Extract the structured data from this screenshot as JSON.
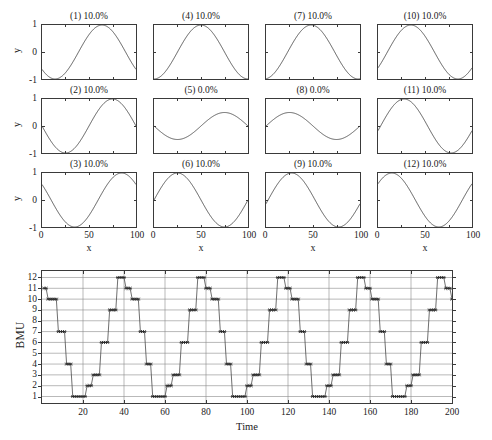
{
  "figure": {
    "background": "#ffffff",
    "line_color": "#4a4a4a",
    "axis_color": "#3a3a3a",
    "grid_color": "#8a8a8a",
    "marker_color": "#2b2b2b"
  },
  "small_multiples": {
    "rows": 3,
    "cols": 4,
    "y_axis_label": "y",
    "x_axis_label": "x",
    "y_ticks": [
      "1",
      "0",
      "-1"
    ],
    "y_tick_values": [
      1,
      0,
      -1
    ],
    "x_ticks": [
      "0",
      "50",
      "100"
    ],
    "x_tick_values": [
      0,
      50,
      100
    ],
    "xlim": [
      0,
      100
    ],
    "ylim": [
      -1,
      1
    ],
    "panels": [
      {
        "index": "1",
        "label": "(1) 10.0%",
        "percent": "10.0%",
        "amplitude": 1.0,
        "period": 100,
        "phase_deg": -140,
        "col": 0,
        "row": 0
      },
      {
        "index": "2",
        "label": "(2) 10.0%",
        "percent": "10.0%",
        "amplitude": 1.0,
        "period": 100,
        "phase_deg": 180,
        "col": 0,
        "row": 1
      },
      {
        "index": "3",
        "label": "(3) 10.0%",
        "percent": "10.0%",
        "amplitude": 1.0,
        "period": 100,
        "phase_deg": 145,
        "col": 0,
        "row": 2
      },
      {
        "index": "4",
        "label": "(4) 10.0%",
        "percent": "10.0%",
        "amplitude": 1.0,
        "period": 100,
        "phase_deg": -90,
        "col": 1,
        "row": 0
      },
      {
        "index": "5",
        "label": "(5) 0.0%",
        "percent": "0.0%",
        "amplitude": 0.5,
        "period": 100,
        "phase_deg": 180,
        "col": 1,
        "row": 1
      },
      {
        "index": "6",
        "label": "(6) 10.0%",
        "percent": "10.0%",
        "amplitude": 1.0,
        "period": 100,
        "phase_deg": 0,
        "col": 1,
        "row": 2
      },
      {
        "index": "7",
        "label": "(7) 10.0%",
        "percent": "10.0%",
        "amplitude": 1.0,
        "period": 100,
        "phase_deg": -83,
        "col": 2,
        "row": 0
      },
      {
        "index": "8",
        "label": "(8) 0.0%",
        "percent": "0.0%",
        "amplitude": 0.5,
        "period": 100,
        "phase_deg": 0,
        "col": 2,
        "row": 1
      },
      {
        "index": "9",
        "label": "(9) 10.0%",
        "percent": "10.0%",
        "amplitude": 1.0,
        "period": 100,
        "phase_deg": -8,
        "col": 2,
        "row": 2
      },
      {
        "index": "10",
        "label": "(10) 10.0%",
        "percent": "10.0%",
        "amplitude": 1.0,
        "period": 100,
        "phase_deg": -36,
        "col": 3,
        "row": 0
      },
      {
        "index": "11",
        "label": "(11) 10.0%",
        "percent": "10.0%",
        "amplitude": 1.0,
        "period": 100,
        "phase_deg": -10,
        "col": 3,
        "row": 1
      },
      {
        "index": "12",
        "label": "(12) 10.0%",
        "percent": "10.0%",
        "amplitude": 1.0,
        "period": 100,
        "phase_deg": 37,
        "col": 3,
        "row": 2
      }
    ]
  },
  "chart_data": {
    "type": "line",
    "title": "",
    "xlabel": "Time",
    "ylabel": "BMU",
    "xlim": [
      0,
      200
    ],
    "ylim": [
      0.4,
      12.6
    ],
    "grid": true,
    "legend": "none",
    "marker": "asterisk",
    "x_ticks": [
      "20",
      "40",
      "60",
      "80",
      "100",
      "120",
      "140",
      "160",
      "180",
      "200"
    ],
    "x_tick_values": [
      20,
      40,
      60,
      80,
      100,
      120,
      140,
      160,
      180,
      200
    ],
    "y_ticks": [
      "1",
      "2",
      "3",
      "4",
      "5",
      "6",
      "7",
      "8",
      "9",
      "10",
      "11",
      "12"
    ],
    "y_tick_values": [
      1,
      2,
      3,
      4,
      5,
      6,
      7,
      8,
      9,
      10,
      11,
      12
    ],
    "x": [
      1,
      2,
      3,
      4,
      5,
      6,
      7,
      8,
      9,
      10,
      11,
      12,
      13,
      14,
      15,
      16,
      17,
      18,
      19,
      20,
      21,
      22,
      23,
      24,
      25,
      26,
      27,
      28,
      29,
      30,
      31,
      32,
      33,
      34,
      35,
      36,
      37,
      38,
      39,
      40,
      41,
      42,
      43,
      44,
      45,
      46,
      47,
      48,
      49,
      50,
      51,
      52,
      53,
      54,
      55,
      56,
      57,
      58,
      59,
      60,
      61,
      62,
      63,
      64,
      65,
      66,
      67,
      68,
      69,
      70,
      71,
      72,
      73,
      74,
      75,
      76,
      77,
      78,
      79,
      80,
      81,
      82,
      83,
      84,
      85,
      86,
      87,
      88,
      89,
      90,
      91,
      92,
      93,
      94,
      95,
      96,
      97,
      98,
      99,
      100,
      101,
      102,
      103,
      104,
      105,
      106,
      107,
      108,
      109,
      110,
      111,
      112,
      113,
      114,
      115,
      116,
      117,
      118,
      119,
      120,
      121,
      122,
      123,
      124,
      125,
      126,
      127,
      128,
      129,
      130,
      131,
      132,
      133,
      134,
      135,
      136,
      137,
      138,
      139,
      140,
      141,
      142,
      143,
      144,
      145,
      146,
      147,
      148,
      149,
      150,
      151,
      152,
      153,
      154,
      155,
      156,
      157,
      158,
      159,
      160,
      161,
      162,
      163,
      164,
      165,
      166,
      167,
      168,
      169,
      170,
      171,
      172,
      173,
      174,
      175,
      176,
      177,
      178,
      179,
      180,
      181,
      182,
      183,
      184,
      185,
      186,
      187,
      188,
      189,
      190,
      191,
      192,
      193,
      194,
      195,
      196,
      197,
      198,
      199,
      200
    ],
    "values": [
      11,
      11,
      10,
      10,
      10,
      10,
      10,
      7,
      7,
      7,
      7,
      4,
      4,
      4,
      1,
      1,
      1,
      1,
      1,
      1,
      1,
      2,
      2,
      2,
      3,
      3,
      3,
      3,
      6,
      6,
      6,
      6,
      9,
      9,
      9,
      9,
      12,
      12,
      12,
      12,
      11,
      11,
      11,
      10,
      10,
      10,
      10,
      7,
      7,
      7,
      4,
      4,
      4,
      1,
      1,
      1,
      1,
      1,
      1,
      1,
      2,
      2,
      2,
      3,
      3,
      3,
      3,
      6,
      6,
      6,
      6,
      9,
      9,
      9,
      9,
      12,
      12,
      12,
      12,
      11,
      11,
      11,
      10,
      10,
      10,
      10,
      7,
      7,
      7,
      4,
      4,
      4,
      1,
      1,
      1,
      1,
      1,
      1,
      1,
      2,
      2,
      2,
      3,
      3,
      3,
      3,
      6,
      6,
      6,
      6,
      9,
      9,
      9,
      9,
      12,
      12,
      12,
      12,
      11,
      11,
      11,
      10,
      10,
      10,
      10,
      7,
      7,
      7,
      4,
      4,
      4,
      1,
      1,
      1,
      1,
      1,
      1,
      1,
      2,
      2,
      2,
      3,
      3,
      3,
      3,
      6,
      6,
      6,
      6,
      9,
      9,
      9,
      9,
      12,
      12,
      12,
      12,
      11,
      11,
      11,
      10,
      10,
      10,
      10,
      7,
      7,
      7,
      4,
      4,
      4,
      1,
      1,
      1,
      1,
      1,
      1,
      1,
      2,
      2,
      2,
      3,
      3,
      3,
      3,
      6,
      6,
      6,
      6,
      9,
      9,
      9,
      9,
      12,
      12,
      12,
      12,
      11,
      11,
      11,
      10
    ],
    "period": 50,
    "cycle_count": 4
  }
}
